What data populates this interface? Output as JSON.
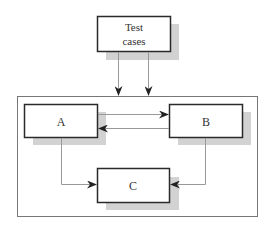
{
  "diagram": {
    "type": "flow",
    "nodes": [
      {
        "id": "test_cases",
        "label_lines": [
          "Test",
          "cases"
        ]
      },
      {
        "id": "A",
        "label": "A"
      },
      {
        "id": "B",
        "label": "B"
      },
      {
        "id": "C",
        "label": "C"
      }
    ],
    "edges": [
      {
        "from": "test_cases",
        "to": "system_boundary",
        "count": 2
      },
      {
        "from": "A",
        "to": "B"
      },
      {
        "from": "B",
        "to": "A"
      },
      {
        "from": "A",
        "to": "C"
      },
      {
        "from": "B",
        "to": "C"
      }
    ],
    "container": {
      "id": "system_boundary",
      "contains": [
        "A",
        "B",
        "C"
      ]
    }
  },
  "labels": {
    "test_line1": "Test",
    "test_line2": "cases",
    "a": "A",
    "b": "B",
    "c": "C"
  },
  "colors": {
    "box_border": "#2a2a2a",
    "shadow": "#cfcfcf",
    "line": "#9a9a9a",
    "arrowhead": "#222222",
    "container": "#777777"
  }
}
